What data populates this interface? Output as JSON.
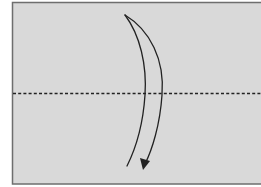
{
  "diagram": {
    "type": "origami-fold-step",
    "instruction": "valley fold in half along dashed line",
    "colors": {
      "paper": "#d9d9d9",
      "paper_border": "#6e6e6e",
      "line": "#222222",
      "background": "#ffffff"
    },
    "elements": [
      {
        "name": "paper-sheet",
        "shape": "rectangle"
      },
      {
        "name": "fold-line",
        "style": "dashed",
        "orientation": "horizontal"
      },
      {
        "name": "fold-arrow",
        "direction": "top-to-bottom"
      }
    ]
  }
}
